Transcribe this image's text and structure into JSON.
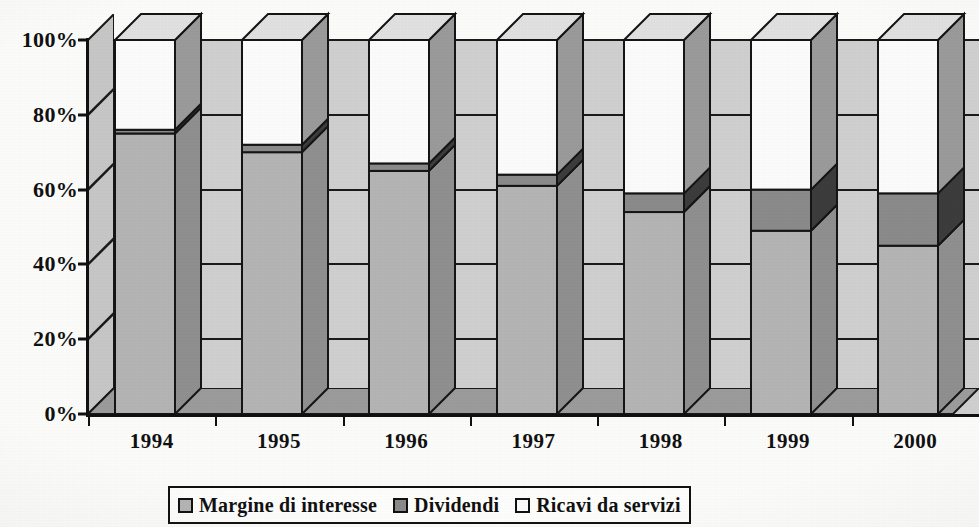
{
  "chart_data": {
    "type": "bar",
    "subtype": "100% stacked 3D column",
    "title": "",
    "xlabel": "",
    "ylabel": "",
    "categories": [
      "1994",
      "1995",
      "1996",
      "1997",
      "1998",
      "1999",
      "2000"
    ],
    "ylim": [
      0,
      100
    ],
    "ytick_labels": [
      "0%",
      "20%",
      "40%",
      "60%",
      "80%",
      "100%"
    ],
    "ytick_values": [
      0,
      20,
      40,
      60,
      80,
      100
    ],
    "grid": true,
    "legend_position": "bottom",
    "units": "percent",
    "series": [
      {
        "name": "Margine di interesse",
        "color": "#b4b4b4",
        "values": [
          75,
          70,
          65,
          61,
          54,
          49,
          45
        ]
      },
      {
        "name": "Dividendi",
        "color": "#8a8a8a",
        "values": [
          1,
          2,
          2,
          3,
          5,
          11,
          14
        ]
      },
      {
        "name": "Ricavi da servizi",
        "color": "#fbfbfb",
        "values": [
          24,
          28,
          33,
          36,
          41,
          40,
          41
        ]
      }
    ]
  },
  "colors": {
    "series_1_front": "#b4b4b4",
    "series_1_side": "#8f8f8f",
    "series_1_top": "#cdcdcd",
    "series_2_front": "#8a8a8a",
    "series_2_side": "#3c3c3c",
    "series_2_top": "#a4a4a4",
    "series_3_front": "#fbfbfb",
    "series_3_side": "#9a9a9a",
    "series_3_top": "#e0e0e0",
    "backwall": "#cfcfcf",
    "outline": "#151515",
    "paper": "#fbfbfa"
  },
  "legend": {
    "items": [
      {
        "label": "Margine di interesse",
        "swatch": "#b4b4b4"
      },
      {
        "label": "Dividendi",
        "swatch": "#8a8a8a"
      },
      {
        "label": "Ricavi da servizi",
        "swatch": "#fbfbfb"
      }
    ]
  }
}
